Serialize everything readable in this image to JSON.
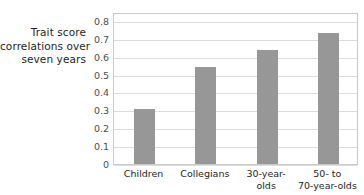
{
  "chart_data": {
    "type": "bar",
    "title": "",
    "subtitle": "",
    "xlabel": "",
    "ylabel": "Trait score correlations over seven years",
    "ylabel_lines": [
      "Trait score",
      "correlations over",
      "seven years"
    ],
    "categories": [
      "Children",
      "Collegians",
      "30-year-olds",
      "50- to 70-year-olds"
    ],
    "category_label_lines": [
      [
        "Children"
      ],
      [
        "Collegians"
      ],
      [
        "30-year-",
        "olds"
      ],
      [
        "50- to",
        "70-year-olds"
      ]
    ],
    "values": [
      0.31,
      0.54,
      0.635,
      0.735
    ],
    "ylim": [
      0,
      0.85
    ],
    "yticks": [
      0,
      0.1,
      0.2,
      0.3,
      0.4,
      0.5,
      0.6,
      0.7,
      0.8
    ],
    "ytick_labels": [
      "0",
      "0.1",
      "0.2",
      "0.3",
      "0.4",
      "0.5",
      "0.6",
      "0.7",
      "0.8"
    ],
    "grid": true,
    "grid_axis": "y",
    "legend": false,
    "legend_position": "none",
    "bar_color": "#979797",
    "grid_color": "#dcdcdc",
    "plot_border_color": "#c9c9c9",
    "text_color": "#231f20",
    "background_color": "#ffffff"
  }
}
